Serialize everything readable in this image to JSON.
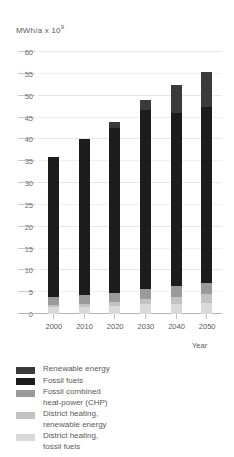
{
  "chart_data": {
    "type": "bar",
    "stacked": true,
    "title": "",
    "subtitle": "",
    "xlabel": "Year",
    "ylabel": "MWh/a x 10⁹",
    "ylabel_base": "MWh/a x 10",
    "ylabel_exp": "9",
    "categories": [
      "2000",
      "2010",
      "2020",
      "2030",
      "2040",
      "2050"
    ],
    "ylim": [
      0,
      60
    ],
    "yticks": [
      0,
      5,
      10,
      15,
      20,
      25,
      30,
      35,
      40,
      45,
      50,
      55,
      60
    ],
    "ytick_labels": [
      "0",
      "5",
      "10",
      "15",
      "20",
      "25",
      "30",
      "35",
      "40",
      "45",
      "50",
      "55",
      "60"
    ],
    "grid": true,
    "legend_position": "below",
    "series": [
      {
        "name": "District heating, fossil fuels",
        "key": "dh-fossil",
        "color": "#d9d9d9",
        "values": [
          1.5,
          1.6,
          1.8,
          2.2,
          2.4,
          2.5
        ]
      },
      {
        "name": "District heating, renewable energy",
        "key": "dh-renewable",
        "color": "#c2c2c2",
        "values": [
          0.6,
          0.7,
          0.9,
          1.3,
          1.6,
          2.0
        ]
      },
      {
        "name": "Fossil combined heat-power (CHP)",
        "key": "chp",
        "color": "#9a9a9a",
        "values": [
          1.9,
          2.0,
          2.1,
          2.3,
          2.4,
          2.5
        ]
      },
      {
        "name": "Fossil fuels",
        "key": "fossil",
        "color": "#1c1c1c",
        "values": [
          32.0,
          35.7,
          37.8,
          40.9,
          39.6,
          40.4
        ]
      },
      {
        "name": "Renewable energy",
        "key": "renewable",
        "color": "#3a3a3a",
        "values": [
          0.0,
          0.0,
          1.4,
          2.3,
          6.5,
          8.1
        ]
      }
    ],
    "totals": [
      36.0,
      40.0,
      44.0,
      49.0,
      52.5,
      55.5
    ]
  },
  "legend": {
    "items": [
      {
        "label": "Renewable energy",
        "color": "#3a3a3a",
        "swatch": "renewable"
      },
      {
        "label": "Fossil fuels",
        "color": "#1c1c1c",
        "swatch": "fossil"
      },
      {
        "label": "Fossil combined\nheat-power (CHP)",
        "color": "#9a9a9a",
        "swatch": "chp"
      },
      {
        "label": "District heating,\nrenewable energy",
        "color": "#c2c2c2",
        "swatch": "dh-renewable"
      },
      {
        "label": "District heating,\nfossil fuels",
        "color": "#d9d9d9",
        "swatch": "dh-fossil"
      }
    ]
  }
}
